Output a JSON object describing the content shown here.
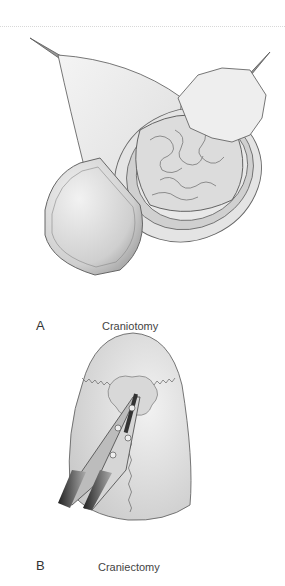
{
  "panels": [
    {
      "letter": "A",
      "caption": "Craniotomy"
    },
    {
      "letter": "B",
      "caption": "Craniectomy"
    }
  ],
  "colors": {
    "line": "#666666",
    "skin": "#e6e6e6",
    "brain": "#d6d6d6",
    "dura": "#bdbdbd",
    "bone": "#c8c8c8"
  }
}
